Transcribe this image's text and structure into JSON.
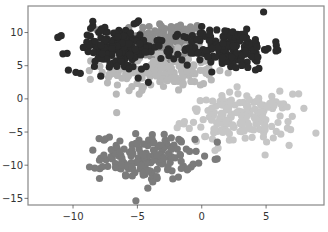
{
  "chart_data": {
    "type": "scatter",
    "title": "",
    "xlabel": "",
    "ylabel": "",
    "xlim": [
      -13.5,
      9.5
    ],
    "ylim": [
      -16,
      14
    ],
    "grid": false,
    "legend": null,
    "x_ticks": [
      -10,
      -5,
      0,
      5
    ],
    "x_tick_labels": [
      "−10",
      "−5",
      "0",
      "5"
    ],
    "y_ticks": [
      10,
      5,
      0,
      -5,
      -10,
      -15
    ],
    "y_tick_labels": [
      "10",
      "5",
      "0",
      "−5",
      "−10",
      "−15"
    ],
    "marker_radius_px": 3.6,
    "series": [
      {
        "name": "cluster-upper-mid",
        "color": "#8e8e8e",
        "center": [
          -3.0,
          8.6
        ],
        "spread": [
          2.0,
          1.6
        ],
        "n": 170
      },
      {
        "name": "cluster-upper-light",
        "color": "#b8b8b8",
        "center": [
          -3.2,
          4.2
        ],
        "spread": [
          2.2,
          1.5
        ],
        "n": 170
      },
      {
        "name": "cluster-right-light",
        "color": "#c6c6c6",
        "center": [
          3.0,
          -3.0
        ],
        "spread": [
          2.1,
          1.9
        ],
        "n": 170
      },
      {
        "name": "cluster-bottom",
        "color": "#7b7b7b",
        "center": [
          -4.2,
          -8.8
        ],
        "spread": [
          1.8,
          1.7
        ],
        "n": 170
      },
      {
        "name": "cluster-left-dark",
        "color": "#2a2a2a",
        "center": [
          -6.6,
          7.6
        ],
        "spread": [
          1.8,
          1.7
        ],
        "n": 170
      },
      {
        "name": "cluster-right-dark",
        "color": "#2a2a2a",
        "center": [
          2.0,
          7.6
        ],
        "spread": [
          1.7,
          1.6
        ],
        "n": 170
      }
    ]
  },
  "axes": {
    "frame_color": "#888888",
    "plot_left_px": 28,
    "plot_right_px": 324,
    "plot_top_px": 6,
    "plot_bottom_px": 205
  }
}
